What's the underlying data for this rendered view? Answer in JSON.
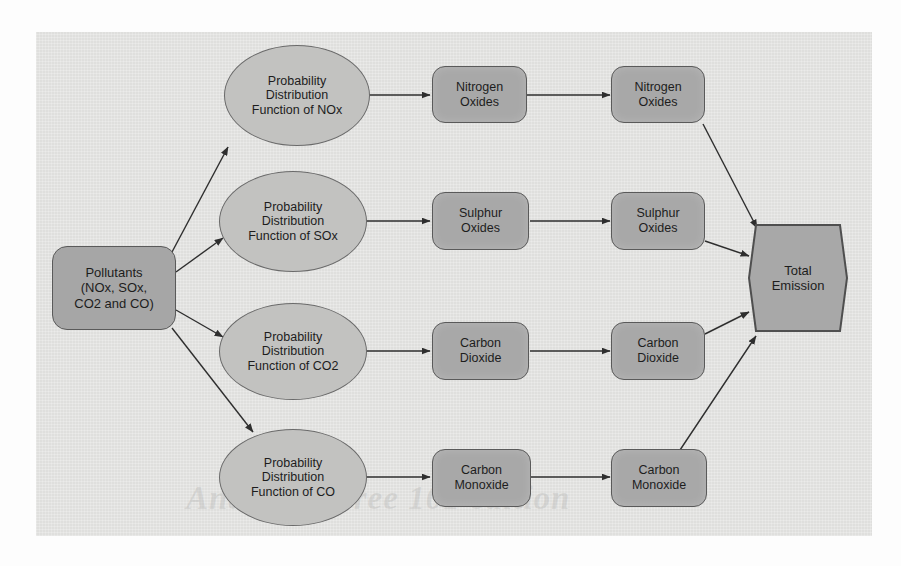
{
  "figure": {
    "watermark": "Analytics Free 101 edition",
    "panel_background": "#e3e3e1",
    "node_fill_box": "#a8a8a8",
    "node_fill_ellipse": "#c2c2c0",
    "node_border": "#5a5a5a",
    "edge_color": "#333333"
  },
  "nodes": {
    "source": {
      "label": "Pollutants\n(NOx, SOx,\nCO2 and CO)",
      "shape": "rounded-rectangle"
    },
    "distributions": [
      {
        "id": "pdf-nox",
        "label": "Probability\nDistribution\nFunction of NOx",
        "shape": "ellipse"
      },
      {
        "id": "pdf-sox",
        "label": "Probability\nDistribution\nFunction of SOx",
        "shape": "ellipse"
      },
      {
        "id": "pdf-co2",
        "label": "Probability\nDistribution\nFunction of CO2",
        "shape": "ellipse"
      },
      {
        "id": "pdf-co",
        "label": "Probability\nDistribution\nFunction of CO",
        "shape": "ellipse"
      }
    ],
    "stage_one": [
      {
        "id": "s1-nox",
        "label": "Nitrogen\nOxides",
        "shape": "rounded-rectangle"
      },
      {
        "id": "s1-sox",
        "label": "Sulphur\nOxides",
        "shape": "rounded-rectangle"
      },
      {
        "id": "s1-co2",
        "label": "Carbon\nDioxide",
        "shape": "rounded-rectangle"
      },
      {
        "id": "s1-co",
        "label": "Carbon\nMonoxide",
        "shape": "rounded-rectangle"
      }
    ],
    "stage_two": [
      {
        "id": "s2-nox",
        "label": "Nitrogen\nOxides",
        "shape": "rounded-rectangle"
      },
      {
        "id": "s2-sox",
        "label": "Sulphur\nOxides",
        "shape": "rounded-rectangle"
      },
      {
        "id": "s2-co2",
        "label": "Carbon\nDioxide",
        "shape": "rounded-rectangle"
      },
      {
        "id": "s2-co",
        "label": "Carbon\nMonoxide",
        "shape": "rounded-rectangle"
      }
    ],
    "terminal": {
      "label": "Total\nEmission",
      "shape": "hexagon"
    }
  },
  "edges": [
    {
      "from": "source",
      "to": "pdf-nox"
    },
    {
      "from": "source",
      "to": "pdf-sox"
    },
    {
      "from": "source",
      "to": "pdf-co2"
    },
    {
      "from": "source",
      "to": "pdf-co"
    },
    {
      "from": "pdf-nox",
      "to": "s1-nox"
    },
    {
      "from": "pdf-sox",
      "to": "s1-sox"
    },
    {
      "from": "pdf-co2",
      "to": "s1-co2"
    },
    {
      "from": "pdf-co",
      "to": "s1-co"
    },
    {
      "from": "s1-nox",
      "to": "s2-nox"
    },
    {
      "from": "s1-sox",
      "to": "s2-sox"
    },
    {
      "from": "s1-co2",
      "to": "s2-co2"
    },
    {
      "from": "s1-co",
      "to": "s2-co"
    },
    {
      "from": "s2-nox",
      "to": "terminal"
    },
    {
      "from": "s2-sox",
      "to": "terminal"
    },
    {
      "from": "s2-co2",
      "to": "terminal"
    },
    {
      "from": "s2-co",
      "to": "terminal"
    }
  ]
}
